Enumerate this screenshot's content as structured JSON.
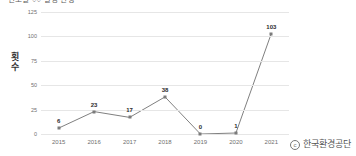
{
  "title": "연도별 ○○ 발생 현황",
  "watermark": {
    "copyright_symbol": "c",
    "owner": "한국환경공단"
  },
  "chart_data": {
    "type": "line",
    "title": "연도별 ○○ 발생 현황",
    "xlabel": "",
    "ylabel": "횟수",
    "ylabel_chars": [
      "횟",
      "수"
    ],
    "categories": [
      "2015",
      "2016",
      "2017",
      "2018",
      "2019",
      "2020",
      "2021"
    ],
    "values": [
      6,
      23,
      17,
      38,
      0,
      1,
      103
    ],
    "point_labels": [
      "6",
      "23",
      "17",
      "38",
      "0",
      "1",
      "103"
    ],
    "yticks": [
      "0",
      "25",
      "50",
      "75",
      "100",
      "125"
    ],
    "ylim": [
      0,
      125
    ],
    "grid": true,
    "legend": "none",
    "series_color": "#808080",
    "marker_color": "#7b7b7b",
    "gridline_color": "#e6e6e6",
    "background": "#ffffff"
  }
}
